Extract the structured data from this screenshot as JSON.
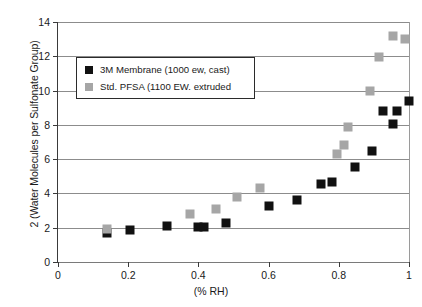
{
  "chart_data": {
    "type": "scatter",
    "title": "",
    "xlabel": "(% RH)",
    "ylabel": "2 (Water Molecules per Sulfonate Group)",
    "xlim": [
      0,
      1
    ],
    "ylim": [
      0,
      14
    ],
    "xticks": [
      "0",
      "0.2",
      "0.4",
      "0.6",
      "0.8",
      "1"
    ],
    "xtick_values": [
      0,
      0.2,
      0.4,
      0.6,
      0.8,
      1
    ],
    "yticks": [
      "0",
      "2",
      "4",
      "6",
      "8",
      "10",
      "12",
      "14"
    ],
    "ytick_values": [
      0,
      2,
      4,
      6,
      8,
      10,
      12,
      14
    ],
    "grid": "horizontal",
    "legend_position": "upper-left",
    "series": [
      {
        "name": "3M Membrane (1000 ew, cast)",
        "color": "#111111",
        "marker": "square",
        "points": [
          [
            0.14,
            1.7
          ],
          [
            0.205,
            1.88
          ],
          [
            0.31,
            2.1
          ],
          [
            0.4,
            2.02
          ],
          [
            0.415,
            2.05
          ],
          [
            0.48,
            2.25
          ],
          [
            0.6,
            3.28
          ],
          [
            0.68,
            3.6
          ],
          [
            0.75,
            4.55
          ],
          [
            0.78,
            4.65
          ],
          [
            0.845,
            5.55
          ],
          [
            0.895,
            6.5
          ],
          [
            0.925,
            8.8
          ],
          [
            0.955,
            8.05
          ],
          [
            0.965,
            8.8
          ],
          [
            1.0,
            9.4
          ]
        ]
      },
      {
        "name": "Std. PFSA (1100 EW. extruded",
        "color": "#a6a6a6",
        "marker": "square",
        "points": [
          [
            0.14,
            1.95
          ],
          [
            0.375,
            2.82
          ],
          [
            0.45,
            3.12
          ],
          [
            0.51,
            3.78
          ],
          [
            0.575,
            4.3
          ],
          [
            0.795,
            6.32
          ],
          [
            0.815,
            6.82
          ],
          [
            0.825,
            7.9
          ],
          [
            0.89,
            9.98
          ],
          [
            0.915,
            11.95
          ],
          [
            0.955,
            13.18
          ],
          [
            0.99,
            13.02
          ]
        ]
      }
    ]
  }
}
